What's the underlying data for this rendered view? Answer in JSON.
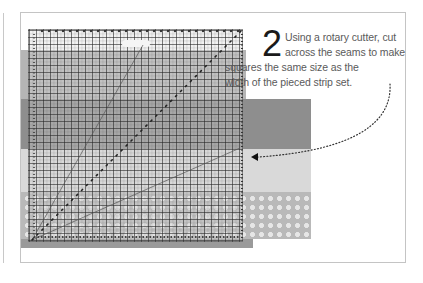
{
  "figure": {
    "step_number": "2",
    "instruction_lines": [
      "Using a rotary cutter, cut",
      "across the seams to make",
      "squares the same size as the",
      "width of the pieced strip set."
    ],
    "instruction_text": "Using a rotary cutter, cut across the seams to make squares the same size as the width of the pieced strip set.",
    "illustration": {
      "subject": "square quilting ruler over pieced fabric strip set",
      "elements": [
        "quilting-ruler",
        "ruler-handle",
        "diagonal-guide-lines",
        "fabric-strips",
        "dotted-arrow"
      ],
      "fabric_strips": [
        {
          "name": "medium-gray-strip",
          "color": "#b5b5b5"
        },
        {
          "name": "dark-gray-strip",
          "color": "#8e8e8e"
        },
        {
          "name": "light-gray-strip",
          "color": "#d9d9d9"
        },
        {
          "name": "dotted-print-strip",
          "color": "#b9b9b9"
        }
      ],
      "arrow": {
        "style": "dotted",
        "direction": "left",
        "points_to": "seam between dark and light strips"
      }
    },
    "colors": {
      "frame_border": "#c4c4c4",
      "text": "#5a5a5a",
      "step_number": "#1a1a1a"
    }
  }
}
